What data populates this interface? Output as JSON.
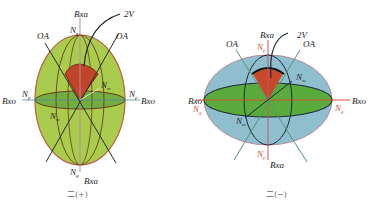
{
  "diagrams": [
    {
      "id": "positive",
      "caption": "二(+)",
      "labels": {
        "top_axis": "Bxa",
        "bottom_axis": "Bxa",
        "left_axis": "Bxo",
        "right_axis": "Bxo",
        "optic_axis_left": "OA",
        "optic_axis_right": "OA",
        "angle": "2V",
        "n_top": "N",
        "n_top_sub": "g",
        "n_bottom": "N",
        "n_bottom_sub": "g",
        "n_left": "N",
        "n_left_sub": "p",
        "n_right": "N",
        "n_right_sub": "p",
        "n_m_upper": "N",
        "n_m_upper_sub": "m",
        "n_m_lower": "N",
        "n_m_lower_sub": "m"
      },
      "colors": {
        "ellipsoid": "#a9cc4e",
        "section": "#5fa63a",
        "outline": "#6b3a1c",
        "wedge": "#c0452a"
      }
    },
    {
      "id": "negative",
      "caption": "二(−)",
      "labels": {
        "top_axis": "Bxa",
        "bottom_axis": "Bxa",
        "left_axis": "Bxo",
        "right_axis": "Bxo",
        "optic_axis_left": "OA",
        "optic_axis_right": "OA",
        "angle": "2V",
        "n_top": "N",
        "n_top_sub": "p",
        "n_bottom": "N",
        "n_bottom_sub": "p",
        "n_left": "N",
        "n_left_sub": "g",
        "n_right": "N",
        "n_right_sub": "g",
        "n_m_upper": "N",
        "n_m_upper_sub": "m",
        "n_m_lower": "N",
        "n_m_lower_sub": "m"
      },
      "colors": {
        "ellipsoid": "#8fbfcf",
        "section": "#5aab3c",
        "outline": "#1e2a3a",
        "wedge": "#c9472b",
        "axis": "#d2502e",
        "optic_axis": "#4e9a6a"
      }
    }
  ]
}
